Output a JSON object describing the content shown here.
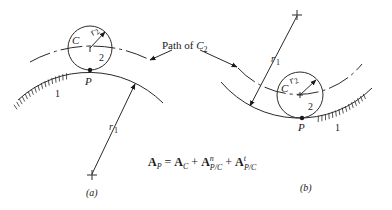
{
  "figure": {
    "path_label": "Path of ",
    "path_label_sub_symbol": "C",
    "path_label_sub": "2",
    "equation": {
      "lhs_symbol": "A",
      "lhs_sub": "P",
      "equals": "=",
      "term1_symbol": "A",
      "term1_sub": "C",
      "plus1": "+",
      "term2_symbol": "A",
      "term2_sup": "n",
      "term2_sub": "P/C",
      "plus2": "+",
      "term3_symbol": "A",
      "term3_sup": "t",
      "term3_sub": "P/C"
    },
    "panel_a": {
      "caption": "(a)",
      "center_label": "C",
      "radius_small_label": "r",
      "radius_small_sub": "2",
      "body_small_label": "2",
      "contact_label": "P",
      "body_large_label": "1",
      "radius_large_label": "r",
      "radius_large_sub": "1"
    },
    "panel_b": {
      "caption": "(b)",
      "center_label": "C",
      "radius_small_label": "r",
      "radius_small_sub": "2",
      "body_small_label": "2",
      "contact_label": "P",
      "body_large_label": "1",
      "radius_large_label": "r",
      "radius_large_sub": "1"
    }
  }
}
